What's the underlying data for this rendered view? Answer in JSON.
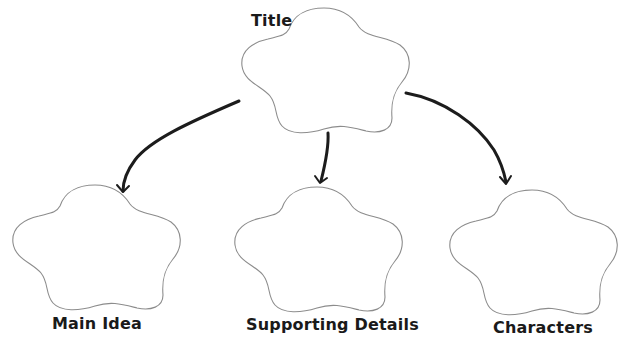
{
  "diagram": {
    "type": "graphic-organizer",
    "title_node": {
      "label": "Title"
    },
    "child_nodes": [
      {
        "label": "Main Idea"
      },
      {
        "label": "Supporting Details"
      },
      {
        "label": "Characters"
      }
    ],
    "edges": [
      {
        "from": "Title",
        "to": "Main Idea"
      },
      {
        "from": "Title",
        "to": "Supporting Details"
      },
      {
        "from": "Title",
        "to": "Characters"
      }
    ],
    "node_shape": "five-lobed cloud",
    "colors": {
      "background": "#ffffff",
      "shape_outline": "#8c8c8c",
      "arrow": "#1c1c1c",
      "text": "#1a1a1a"
    }
  }
}
